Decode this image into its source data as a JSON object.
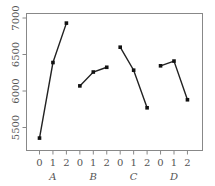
{
  "chart_data": {
    "type": "line",
    "title": "",
    "xlabel": "",
    "ylabel": "",
    "ylim": [
      5330,
      7070
    ],
    "yticks": [
      5500,
      6000,
      6500,
      7000
    ],
    "ytick_labels": [
      "5500",
      "6000",
      "6500",
      "7000"
    ],
    "grid": false,
    "groups": [
      {
        "name": "A",
        "x": [
          "0",
          "1",
          "2"
        ],
        "values": [
          5355,
          6390,
          6930
        ]
      },
      {
        "name": "B",
        "x": [
          "0",
          "1",
          "2"
        ],
        "values": [
          6070,
          6260,
          6325
        ]
      },
      {
        "name": "C",
        "x": [
          "0",
          "1",
          "2"
        ],
        "values": [
          6600,
          6285,
          5770
        ]
      },
      {
        "name": "D",
        "x": [
          "0",
          "1",
          "2"
        ],
        "values": [
          6345,
          6410,
          5880
        ]
      }
    ]
  }
}
